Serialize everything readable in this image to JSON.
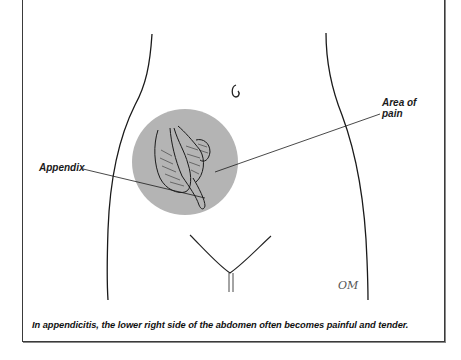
{
  "figure": {
    "labels": {
      "area_of_pain_line1": "Area of",
      "area_of_pain_line2": "pain",
      "appendix": "Appendix"
    },
    "signature": "OM",
    "caption": "In appendicitis, the lower right side of the abdomen often becomes painful and tender.",
    "colors": {
      "pain_area": "#b4b4b4",
      "outline": "#1a1a1a",
      "frame": "#3a3a3a"
    }
  }
}
